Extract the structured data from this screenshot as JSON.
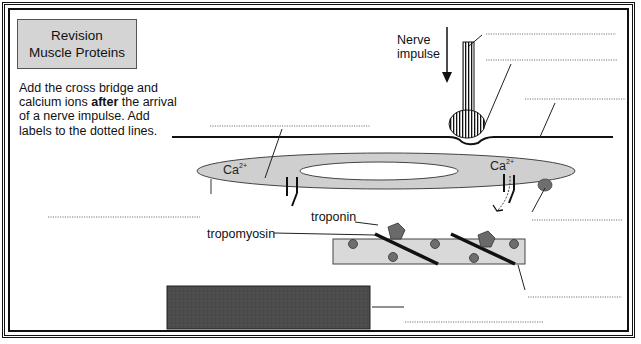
{
  "title": {
    "line1": "Revision",
    "line2": "Muscle Proteins"
  },
  "instructions": {
    "part1": "Add the cross bridge and calcium ions ",
    "bold": "after",
    "part2": " the arrival of a nerve impulse. Add labels to the dotted lines."
  },
  "labels": {
    "nerve_impulse_1": "Nerve",
    "nerve_impulse_2": "impulse",
    "troponin": "troponin",
    "tropomyosin": "tropomyosin",
    "calcium_left": "Ca",
    "calcium_left_charge": "2+",
    "calcium_right": "Ca",
    "calcium_right_charge": "2+"
  },
  "dotted_label_blanks": [
    {
      "id": "blank-1",
      "x1": 486,
      "y1": 34,
      "x2": 616,
      "y2": 34
    },
    {
      "id": "blank-2",
      "x1": 486,
      "y1": 60,
      "x2": 618,
      "y2": 60
    },
    {
      "id": "blank-3",
      "x1": 525,
      "y1": 99,
      "x2": 625,
      "y2": 99
    },
    {
      "id": "blank-4",
      "x1": 210,
      "y1": 126,
      "x2": 370,
      "y2": 126
    },
    {
      "id": "blank-5",
      "x1": 48,
      "y1": 217,
      "x2": 200,
      "y2": 217
    },
    {
      "id": "blank-6",
      "x1": 532,
      "y1": 220,
      "x2": 623,
      "y2": 220
    },
    {
      "id": "blank-7",
      "x1": 528,
      "y1": 297,
      "x2": 622,
      "y2": 297
    },
    {
      "id": "blank-8",
      "x1": 405,
      "y1": 322,
      "x2": 543,
      "y2": 322
    }
  ],
  "colors": {
    "sarcoplasmic_reticulum": "#cfcfcf",
    "thin_filament": "#d9d9d9",
    "actin_binding_site": "#6e6e6e",
    "troponin": "#6a6a6a",
    "myosin_block": "#4a4a4a",
    "title_box": "#d4d4d4",
    "line": "#111111"
  }
}
